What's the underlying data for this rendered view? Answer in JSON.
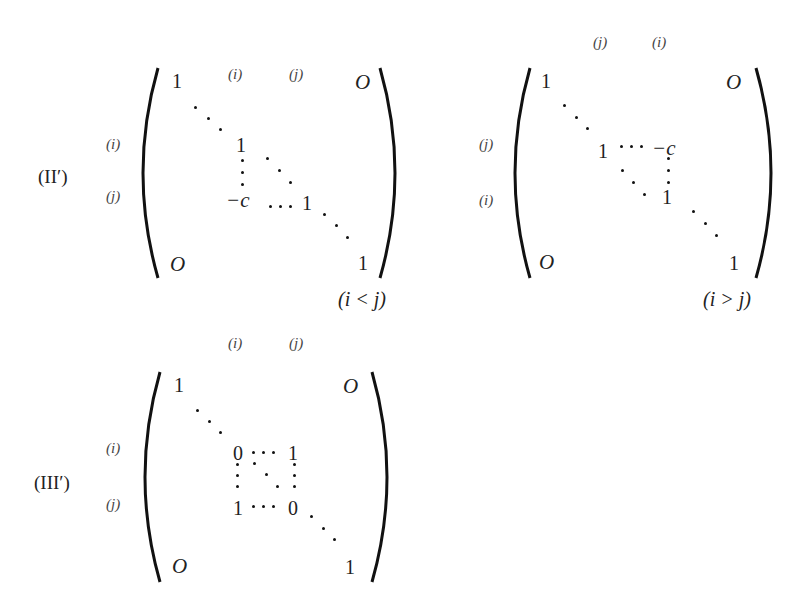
{
  "page": {
    "header_fragment": "§ 2 基本変形と..."
  },
  "matrices": [
    {
      "tag": "(II′)",
      "col_labels": [
        "(i)",
        "(j)"
      ],
      "row_labels": [
        "(i)",
        "(j)"
      ],
      "top_left": "1",
      "top_right": "O",
      "bottom_left": "O",
      "bottom_right": "1",
      "entry_ii": "1",
      "entry_ji": "−c",
      "entry_jj": "1",
      "condition": "(i < j)"
    },
    {
      "tag": "",
      "col_labels": [
        "(j)",
        "(i)"
      ],
      "row_labels": [
        "(j)",
        "(i)"
      ],
      "top_left": "1",
      "top_right": "O",
      "bottom_left": "O",
      "bottom_right": "1",
      "entry_jj": "1",
      "entry_ji": "−c",
      "entry_ii": "1",
      "condition": "(i > j)"
    },
    {
      "tag": "(III′)",
      "col_labels": [
        "(i)",
        "(j)"
      ],
      "row_labels": [
        "(i)",
        "(j)"
      ],
      "top_left": "1",
      "top_right": "O",
      "bottom_left": "O",
      "bottom_right": "1",
      "entry_ii": "0",
      "entry_ij": "1",
      "entry_ji": "1",
      "entry_jj": "0",
      "condition": ""
    }
  ]
}
